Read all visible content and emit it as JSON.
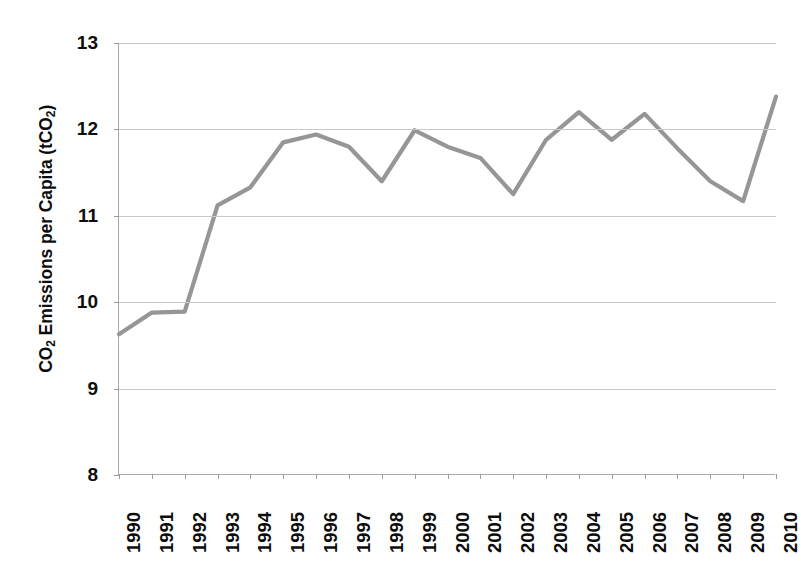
{
  "chart_data": {
    "type": "line",
    "title": "",
    "xlabel": "",
    "ylabel": "CO2 Emissions per Capita (tCO2)",
    "ylabel_parts": {
      "prefix": "CO",
      "sub1": "2",
      "middle": " Emissions per Capita (tCO",
      "sub2": "2",
      "suffix": ")"
    },
    "categories": [
      "1990",
      "1991",
      "1992",
      "1993",
      "1994",
      "1995",
      "1996",
      "1997",
      "1998",
      "1999",
      "2000",
      "2001",
      "2002",
      "2003",
      "2004",
      "2005",
      "2006",
      "2007",
      "2008",
      "2009",
      "2010"
    ],
    "values": [
      9.63,
      9.88,
      9.89,
      11.12,
      11.33,
      11.85,
      11.94,
      11.8,
      11.4,
      11.99,
      11.8,
      11.67,
      11.25,
      11.88,
      12.2,
      11.88,
      12.18,
      11.78,
      11.4,
      11.17,
      12.38
    ],
    "ylim": [
      8,
      13
    ],
    "y_ticks": [
      8,
      9,
      10,
      11,
      12,
      13
    ],
    "y_tick_labels": [
      "8",
      "9",
      "10",
      "11",
      "12",
      "13"
    ],
    "grid": true,
    "grid_axis": "y",
    "legend": null,
    "legend_position": "none",
    "series_color": "#969696",
    "series_line_width": 4.2,
    "gridline_color": "#c9c9c9",
    "axis_color": "#a8a8a8",
    "markers": false
  }
}
